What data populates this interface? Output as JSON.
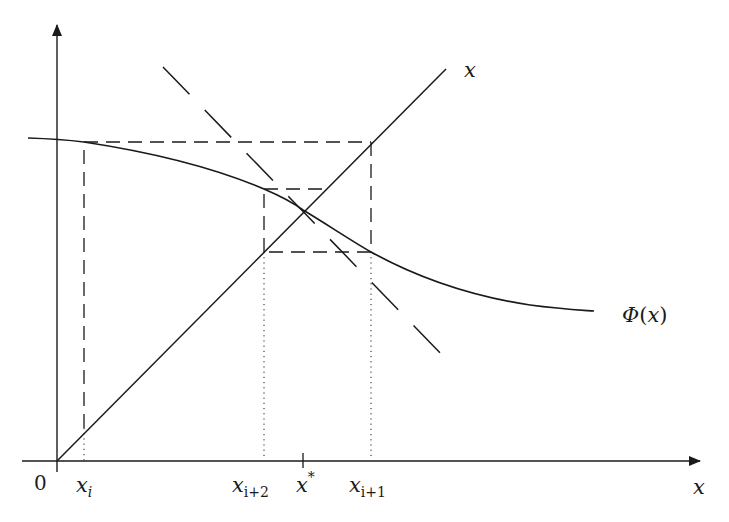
{
  "figure": {
    "colors": {
      "ink": "#1a1a1a",
      "background": "#ffffff"
    },
    "axes": {
      "x_label": "x",
      "origin_label": "0",
      "x_axis": {
        "x1": 22,
        "y": 461,
        "x2": 700
      },
      "y_axis": {
        "x": 57,
        "y1": 470,
        "y2": 27
      }
    },
    "curves": {
      "phi_label": "Φ(x)",
      "phi_label_parts": {
        "func": "Φ",
        "open": "(",
        "arg": "x",
        "close": ")"
      },
      "phi_points": [
        [
          28,
          138
        ],
        [
          57,
          139
        ],
        [
          84,
          142
        ],
        [
          140,
          151
        ],
        [
          200,
          165
        ],
        [
          264,
          189
        ],
        [
          303,
          210
        ],
        [
          340,
          233
        ],
        [
          371,
          252
        ],
        [
          420,
          278
        ],
        [
          470,
          294
        ],
        [
          530,
          305
        ],
        [
          594,
          311
        ]
      ],
      "identity_label": "x",
      "identity_line": {
        "x1": 57,
        "y1": 461,
        "x2": 446,
        "y2": 69
      },
      "tangent_line": {
        "x1": 163,
        "y1": 67,
        "x2": 444,
        "y2": 357
      }
    },
    "ticks": {
      "labels": [
        {
          "name": "x-i",
          "base": "x",
          "sub": "i",
          "x": 84
        },
        {
          "name": "x-i-plus-2",
          "base": "x",
          "sub": "i+2",
          "x": 264
        },
        {
          "name": "x-star",
          "base": "x",
          "sup": "*",
          "x": 303
        },
        {
          "name": "x-i-plus-1",
          "base": "x",
          "sub": "i+1",
          "x": 371
        }
      ]
    },
    "iteration": {
      "big_rect": {
        "x_left": 84,
        "x_right": 371,
        "y_top": 142,
        "y_bottom": 252
      },
      "small_rect": {
        "x_left": 264,
        "x_right": 371,
        "y_top": 189,
        "y_bottom": 252,
        "top_right_x": 325
      },
      "dotted_verticals": [
        84,
        264,
        371
      ],
      "fixed_point": {
        "x": 303,
        "y": 210
      }
    }
  }
}
